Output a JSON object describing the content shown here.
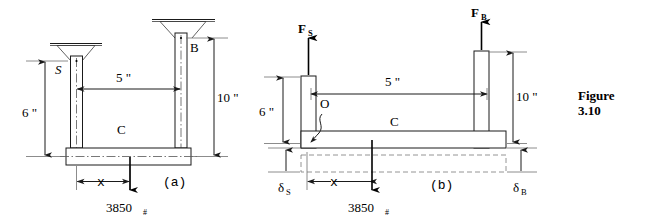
{
  "figure": {
    "caption_line1": "Figure",
    "caption_line2": "3.10"
  },
  "panel_a": {
    "panel_label": "(a)",
    "labels": {
      "support_left": "S",
      "support_right": "B",
      "beam": "C",
      "height_left": "6 \"",
      "height_right": "10 \"",
      "span": "5 \"",
      "offset": "x",
      "load_value": "3850",
      "load_unit": "#"
    }
  },
  "panel_b": {
    "panel_label": "(b)",
    "labels": {
      "force_left": "F",
      "force_left_sub": "S",
      "force_right": "F",
      "force_right_sub": "B",
      "origin": "O",
      "beam": "C",
      "height_left": "6 \"",
      "height_right": "10 \"",
      "span": "5 \"",
      "offset": "x",
      "load_value": "3850",
      "load_unit": "#",
      "delta_left": "δ",
      "delta_left_sub": "S",
      "delta_right": "δ",
      "delta_right_sub": "B"
    }
  },
  "colors": {
    "ink": "#1a1a1a",
    "thin_ink": "#6e6e6e",
    "background": "#ffffff"
  }
}
